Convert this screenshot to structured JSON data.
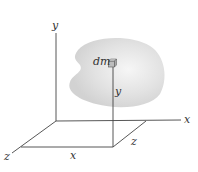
{
  "diagram": {
    "labels": {
      "y_axis": "y",
      "x_axis": "x",
      "z_axis": "z",
      "dm": "dm",
      "y_dist": "y",
      "x_dist": "x",
      "z_dist": "z"
    },
    "colors": {
      "body_fill": "#dcdcdc",
      "body_highlight": "#f4f4f4",
      "axis": "#444444",
      "label": "#333333"
    }
  }
}
